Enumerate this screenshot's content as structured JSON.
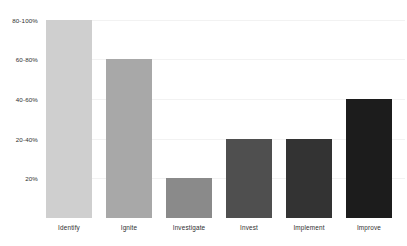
{
  "chart_data": {
    "type": "bar",
    "title": "",
    "subtitle": "",
    "xlabel": "",
    "ylabel": "",
    "grid": true,
    "legend": "none",
    "categories": [
      "Identify",
      "Ignite",
      "Investigate",
      "Invest",
      "Implement",
      "Improve"
    ],
    "values": [
      100,
      80,
      20,
      40,
      40,
      60
    ],
    "value_labels": [
      "80-100%",
      "60-80%",
      "20%",
      "20-40%",
      "20-40%",
      "40-60%"
    ],
    "ylim": [
      0,
      110
    ],
    "ytick_values": [
      20,
      40,
      60,
      80,
      100
    ],
    "ytick_labels": [
      "20%",
      "20-40%",
      "40-60%",
      "60-80%",
      "80-100%"
    ],
    "bar_colors": [
      "#cfcfcf",
      "#a8a8a8",
      "#8a8a8a",
      "#4f4f4f",
      "#333333",
      "#1c1c1c"
    ],
    "background_color": "#ffffff",
    "gridline_color": "#f2f2f2",
    "text_color": "#2f2f2f"
  }
}
